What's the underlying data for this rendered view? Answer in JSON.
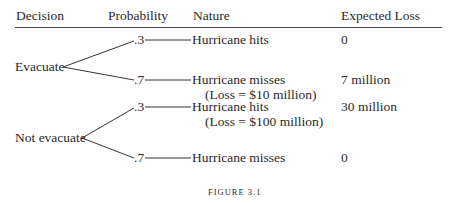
{
  "figure": {
    "headers": {
      "decision": "Decision",
      "probability": "Probability",
      "nature": "Nature",
      "expected_loss": "Expected Loss"
    },
    "decisions": [
      {
        "label": "Evacuate",
        "branches": [
          {
            "probability": ".3",
            "nature": "Hurricane hits",
            "nature_note": "",
            "expected_loss": "0"
          },
          {
            "probability": ".7",
            "nature": "Hurricane misses",
            "nature_note": "(Loss = $10 million)",
            "expected_loss": "7 million"
          }
        ]
      },
      {
        "label": "Not evacuate",
        "branches": [
          {
            "probability": ".3",
            "nature": "Hurricane hits",
            "nature_note": "(Loss = $100 million)",
            "expected_loss": "30 million"
          },
          {
            "probability": ".7",
            "nature": "Hurricane misses",
            "nature_note": "",
            "expected_loss": "0"
          }
        ]
      }
    ],
    "caption": "FIGURE 3.1"
  }
}
